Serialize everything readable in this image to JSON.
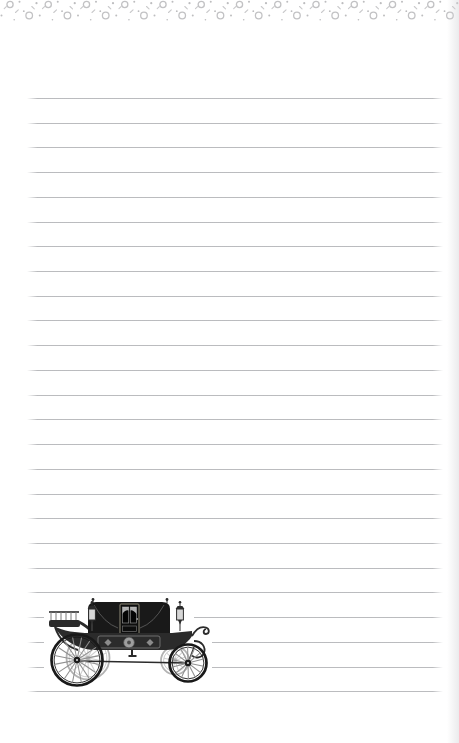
{
  "page": {
    "width": 459,
    "height": 743,
    "background_color": "#ffffff",
    "edge_shadow_color": "#d6d6da"
  },
  "decorative_border": {
    "motif": "confetti rings, dots and dashes",
    "tile_width": 38.25,
    "tile_count": 13,
    "height": 26,
    "ring_color": "#c2c2c4",
    "dot_color": "#bdbdbf",
    "dash_color": "#c9c9cb",
    "rings": [
      {
        "cx": 10.0,
        "cy": 4.5,
        "r": 3.1
      },
      {
        "cx": 29.2,
        "cy": 15.5,
        "r": 3.3
      }
    ],
    "dots": [
      {
        "cx": 1.5,
        "cy": 15.5,
        "r": 1.0
      },
      {
        "cx": 19.5,
        "cy": 1.8,
        "r": 1.0
      },
      {
        "cx": 23.8,
        "cy": 11.2,
        "r": 0.9
      },
      {
        "cx": 36.5,
        "cy": 3.2,
        "r": 1.1
      },
      {
        "cx": 14.2,
        "cy": 19.8,
        "r": 0.8
      }
    ],
    "dashes": [
      {
        "x1": 15.5,
        "y1": 12.5,
        "x2": 18.3,
        "y2": 9.8
      },
      {
        "x1": 31.8,
        "y1": 6.5,
        "x2": 34.3,
        "y2": 8.9
      },
      {
        "x1": 4.2,
        "y1": 8.7,
        "x2": 6.3,
        "y2": 6.6
      }
    ]
  },
  "ruled_lines": {
    "count": 25,
    "first_y": 98,
    "spacing": 24.72,
    "left": 27,
    "right": 443,
    "color": "#b7b8bb",
    "thickness": 1
  },
  "illustration": {
    "name": "vintage horse-drawn carriage",
    "x": 44,
    "y": 597,
    "width": 168,
    "height": 92,
    "palette": {
      "black": "#191919",
      "dark": "#2b2b2b",
      "mid": "#7a7a7a",
      "light": "#b3b3b3",
      "spoke": "#909090",
      "far_spoke": "#d0d0d0",
      "lamp": "#d6d6d6",
      "ornament": "#9e9e9e",
      "curtain": "#cfcfcf",
      "frame": "#8f8a78"
    },
    "wheels": [
      {
        "cx": 44,
        "cy": 61,
        "r": 21.5,
        "spokes": 14,
        "far": true
      },
      {
        "cx": 131,
        "cy": 63.5,
        "r": 14,
        "spokes": 12,
        "far": true
      },
      {
        "cx": 33,
        "cy": 63,
        "r": 25.5,
        "spokes": 16,
        "far": false
      },
      {
        "cx": 144,
        "cy": 66,
        "r": 18.5,
        "spokes": 14,
        "far": false
      }
    ]
  }
}
